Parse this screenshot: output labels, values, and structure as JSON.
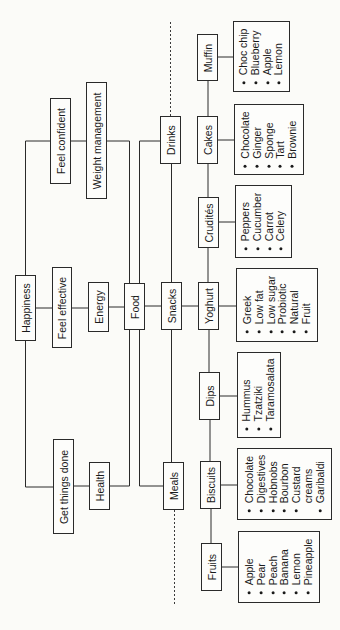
{
  "diagram": {
    "orientation": "rotated -90deg (read bottom-to-top)",
    "root": {
      "label": "Happiness"
    },
    "level1": [
      {
        "id": "feel_confident",
        "label": "Feel confident"
      },
      {
        "id": "feel_effective",
        "label": "Feel effective"
      },
      {
        "id": "get_things_done",
        "label": "Get things done"
      }
    ],
    "level2": [
      {
        "id": "weight_management",
        "label": "Weight management",
        "parent": "feel_confident"
      },
      {
        "id": "energy",
        "label": "Energy",
        "parent": "feel_effective"
      },
      {
        "id": "health",
        "label": "Health",
        "parent": "get_things_done"
      }
    ],
    "food": {
      "label": "Food"
    },
    "food_groups": [
      {
        "id": "drinks",
        "label": "Drinks"
      },
      {
        "id": "snacks",
        "label": "Snacks"
      },
      {
        "id": "meals",
        "label": "Meals"
      }
    ],
    "snack_types": [
      {
        "id": "muffin",
        "label": "Muffin",
        "items": [
          "Choc chip",
          "Blueberry",
          "Apple",
          "Lemon"
        ]
      },
      {
        "id": "cakes",
        "label": "Cakes",
        "items": [
          "Chocolate",
          "Ginger",
          "Sponge",
          "Tart",
          "Brownie"
        ]
      },
      {
        "id": "crudites",
        "label": "Crudités",
        "items": [
          "Peppers",
          "Cucumber",
          "Carrot",
          "Celery"
        ]
      },
      {
        "id": "yoghurt",
        "label": "Yoghurt",
        "items": [
          "Greek",
          "Low fat",
          "Low sugar",
          "Probiotic",
          "Natural",
          "Fruit"
        ]
      },
      {
        "id": "dips",
        "label": "Dips",
        "items": [
          "Hummus",
          "Tzatziki",
          "Taramosalata"
        ]
      },
      {
        "id": "biscuits",
        "label": "Biscuits",
        "items": [
          "Chocolate",
          "Digestives",
          "Hobnobs",
          "Bourbon",
          "Custard",
          "creams",
          "Garibaldi"
        ]
      },
      {
        "id": "fruits",
        "label": "Fruits",
        "items": [
          "Apple",
          "Pear",
          "Peach",
          "Banana",
          "Lemon",
          "Pineapple"
        ]
      }
    ]
  },
  "colors": {
    "background": "#fbfbf8",
    "line": "#2a2a2a"
  }
}
